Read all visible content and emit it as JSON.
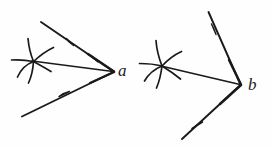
{
  "figure": {
    "background_color": "#fefefe",
    "ink_color": "#1a1a1a",
    "width": 271,
    "height": 147,
    "style": "hand-drawn engraving line art"
  },
  "figures": [
    {
      "id": "figure-a",
      "vertex_label": "a",
      "vertex_label_style": "italic",
      "vertex": {
        "x": 113,
        "y": 71
      },
      "description": "acute angle opening to the left with starburst mark near interior",
      "rays": [
        {
          "name": "upper-ray",
          "from": {
            "x": 41,
            "y": 22
          },
          "to": {
            "x": 113,
            "y": 71
          },
          "arrow_marks": [
            {
              "x": 70,
              "y": 42,
              "direction": "toward-vertex"
            },
            {
              "x": 95,
              "y": 59,
              "direction": "toward-vertex"
            }
          ]
        },
        {
          "name": "lower-ray",
          "from": {
            "x": 22,
            "y": 116
          },
          "to": {
            "x": 113,
            "y": 71
          },
          "arrow_marks": [
            {
              "x": 65,
              "y": 93,
              "direction": "toward-vertex"
            }
          ]
        },
        {
          "name": "middle-ray",
          "from": {
            "x": 33,
            "y": 61
          },
          "to": {
            "x": 113,
            "y": 71
          },
          "arrow_marks": []
        }
      ],
      "starburst": {
        "name": "starburst-mark-a",
        "center": {
          "x": 33,
          "y": 61
        },
        "ray_count": 6,
        "curved": true
      }
    },
    {
      "id": "figure-b",
      "vertex_label": "b",
      "vertex_label_style": "italic",
      "vertex": {
        "x": 240,
        "y": 84
      },
      "description": "obtuse-open angle with steeper rays and starburst mark near interior",
      "rays": [
        {
          "name": "upper-ray",
          "from": {
            "x": 208,
            "y": 12
          },
          "to": {
            "x": 240,
            "y": 84
          },
          "arrow_marks": [
            {
              "x": 216,
              "y": 30,
              "direction": "toward-vertex"
            }
          ]
        },
        {
          "name": "lower-ray",
          "from": {
            "x": 182,
            "y": 139
          },
          "to": {
            "x": 240,
            "y": 84
          },
          "arrow_marks": [
            {
              "x": 196,
              "y": 126,
              "direction": "toward-vertex"
            }
          ]
        },
        {
          "name": "middle-ray",
          "from": {
            "x": 162,
            "y": 66
          },
          "to": {
            "x": 240,
            "y": 84
          },
          "arrow_marks": []
        }
      ],
      "starburst": {
        "name": "starburst-mark-b",
        "center": {
          "x": 162,
          "y": 66
        },
        "ray_count": 6,
        "curved": true
      }
    }
  ]
}
